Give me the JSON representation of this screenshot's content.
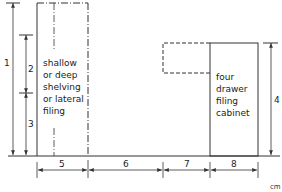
{
  "diagram": {
    "units": "cm",
    "colors": {
      "line": "#333333",
      "background": "#ffffff"
    },
    "shelving_label": [
      "shallow",
      "or deep",
      "shelving",
      "or lateral",
      "filing"
    ],
    "cabinet_label": [
      "four",
      "drawer",
      "filing",
      "cabinet"
    ],
    "vertical_dimensions": [
      {
        "id": "1",
        "label": "1"
      },
      {
        "id": "2",
        "label": "2"
      },
      {
        "id": "3",
        "label": "3"
      },
      {
        "id": "4",
        "label": "4"
      }
    ],
    "horizontal_dimensions": [
      {
        "id": "5",
        "label": "5"
      },
      {
        "id": "6",
        "label": "6"
      },
      {
        "id": "7",
        "label": "7"
      },
      {
        "id": "8",
        "label": "8"
      }
    ]
  }
}
